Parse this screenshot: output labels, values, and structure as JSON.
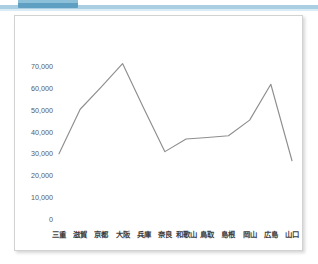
{
  "window": {
    "top_tab_color": "#5e9fc2",
    "top_rule_color": "#aacfe2"
  },
  "card": {
    "border_color": "#d2d2d2",
    "background": "#ffffff"
  },
  "chart_data": {
    "type": "line",
    "title": "",
    "subtitle": "",
    "xlabel": "",
    "ylabel": "",
    "grid": false,
    "legend": false,
    "legend_position": "none",
    "line_color": "#8e8e8e",
    "categories": [
      "三重",
      "滋賀",
      "京都",
      "大阪",
      "兵庫",
      "奈良",
      "和歌山",
      "鳥取",
      "島根",
      "岡山",
      "広島",
      "山口"
    ],
    "values": [
      30000,
      50500,
      60800,
      71500,
      51000,
      31000,
      36800,
      37500,
      38300,
      45500,
      62000,
      26800
    ],
    "series": [
      {
        "name": "",
        "values": [
          30000,
          50500,
          60800,
          71500,
          51000,
          31000,
          36800,
          37500,
          38300,
          45500,
          62000,
          26800
        ]
      }
    ],
    "ylim": [
      0,
      75000
    ],
    "yticks": [
      0,
      10000,
      20000,
      30000,
      40000,
      50000,
      60000,
      70000
    ],
    "ytick_labels": [
      "0",
      "10,000",
      "20,000",
      "30,000",
      "40,000",
      "50,000",
      "60,000",
      "70,000"
    ]
  }
}
